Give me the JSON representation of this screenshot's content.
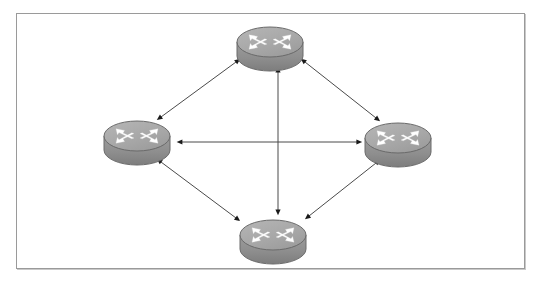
{
  "diagram": {
    "type": "network-topology",
    "frame": {
      "x": 16,
      "y": 13,
      "width": 509,
      "height": 256,
      "border_color": "#9a9a9a",
      "background_color": "#ffffff"
    },
    "palette": {
      "router_top_face": "#a8a8a8",
      "router_top_face_light": "#b8b8b8",
      "router_body": "#949494",
      "router_body_dark": "#828282",
      "router_outline": "#6a6a6a",
      "router_arrow_white": "#ffffff",
      "link_line": "#4a4a4a",
      "link_arrowhead": "#1a1a1a",
      "page_background": "#ffffff"
    },
    "nodes": [
      {
        "id": "router-top",
        "name": "Router Top",
        "icon": "router-icon",
        "label": "",
        "cx": 270,
        "cy": 42,
        "rx": 33,
        "ry": 15,
        "depth": 14
      },
      {
        "id": "router-left",
        "name": "Router Left",
        "icon": "router-icon",
        "label": "",
        "cx": 137,
        "cy": 136,
        "rx": 33,
        "ry": 15,
        "depth": 14
      },
      {
        "id": "router-right",
        "name": "Router Right",
        "icon": "router-icon",
        "label": "",
        "cx": 398,
        "cy": 138,
        "rx": 33,
        "ry": 15,
        "depth": 14
      },
      {
        "id": "router-bottom",
        "name": "Router Bottom",
        "icon": "router-icon",
        "label": "",
        "cx": 273,
        "cy": 235,
        "rx": 33,
        "ry": 15,
        "depth": 14
      }
    ],
    "links": [
      {
        "id": "link-top-left",
        "name": "link-router-top-router-left",
        "from": "router-top",
        "to": "router-left",
        "direction": "bidirectional",
        "x1": 236,
        "y1": 62,
        "x2": 161,
        "y2": 117
      },
      {
        "id": "link-top-right",
        "name": "link-router-top-router-right",
        "from": "router-top",
        "to": "router-right",
        "direction": "bidirectional",
        "x1": 305,
        "y1": 62,
        "x2": 376,
        "y2": 118
      },
      {
        "id": "link-left-bottom",
        "name": "link-router-left-router-bottom",
        "from": "router-left",
        "to": "router-bottom",
        "direction": "bidirectional",
        "x1": 161,
        "y1": 162,
        "x2": 236,
        "y2": 218
      },
      {
        "id": "link-right-bottom",
        "name": "link-router-right-router-bottom",
        "from": "router-right",
        "to": "router-bottom",
        "direction": "bidirectional",
        "x1": 376,
        "y1": 163,
        "x2": 309,
        "y2": 216
      },
      {
        "id": "link-left-right",
        "name": "link-router-left-router-right",
        "from": "router-left",
        "to": "router-right",
        "direction": "bidirectional",
        "x1": 182,
        "y1": 142,
        "x2": 357,
        "y2": 142
      },
      {
        "id": "link-top-bottom",
        "name": "link-router-top-router-bottom",
        "from": "router-top",
        "to": "router-bottom",
        "direction": "bidirectional",
        "x1": 278,
        "y1": 72,
        "x2": 278,
        "y2": 210
      }
    ]
  }
}
